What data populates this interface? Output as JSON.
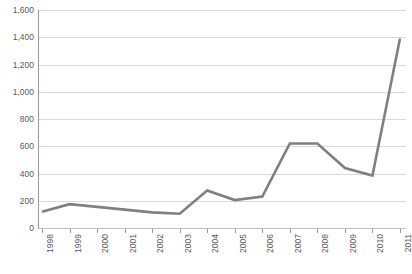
{
  "chart_data": {
    "type": "line",
    "title": "",
    "subtitle": "",
    "xlabel": "",
    "ylabel": "",
    "categories": [
      "1998",
      "1999",
      "2000",
      "2001",
      "2002",
      "2003",
      "2004",
      "2005",
      "2006",
      "2007",
      "2008",
      "2009",
      "2010",
      "2011"
    ],
    "series": [
      {
        "name": "Series 1",
        "color": "#808080",
        "values": [
          120,
          175,
          155,
          135,
          115,
          105,
          275,
          205,
          230,
          620,
          620,
          440,
          385,
          1390
        ]
      }
    ],
    "values": [
      120,
      175,
      155,
      135,
      115,
      105,
      275,
      205,
      230,
      620,
      620,
      440,
      385,
      1390
    ],
    "ylim": [
      0,
      1600
    ],
    "y_ticks": [
      0,
      200,
      400,
      600,
      800,
      1000,
      1200,
      1400,
      1600
    ],
    "y_tick_labels": [
      "0",
      "200",
      "400",
      "600",
      "800",
      "1,000",
      "1,200",
      "1,400",
      "1,600"
    ],
    "grid": true,
    "grid_axis": "y",
    "legend": false,
    "legend_position": "none",
    "markers": false,
    "x_tick_label_rotation": -90,
    "colors": {
      "line": "#808080",
      "gridline": "#d9d9d9",
      "axis": "#9a9a9a",
      "tick_text": "#595959",
      "background": "#ffffff"
    }
  }
}
